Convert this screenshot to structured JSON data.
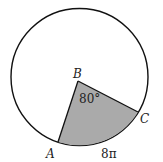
{
  "diagram": {
    "type": "circle-sector",
    "points": {
      "center": "B",
      "A": "A",
      "C": "C"
    },
    "angle_label": "80°",
    "arc_label": "8π",
    "colors": {
      "sector_fill": "#aaaaaa",
      "stroke": "#111111",
      "background": "#ffffff"
    }
  }
}
